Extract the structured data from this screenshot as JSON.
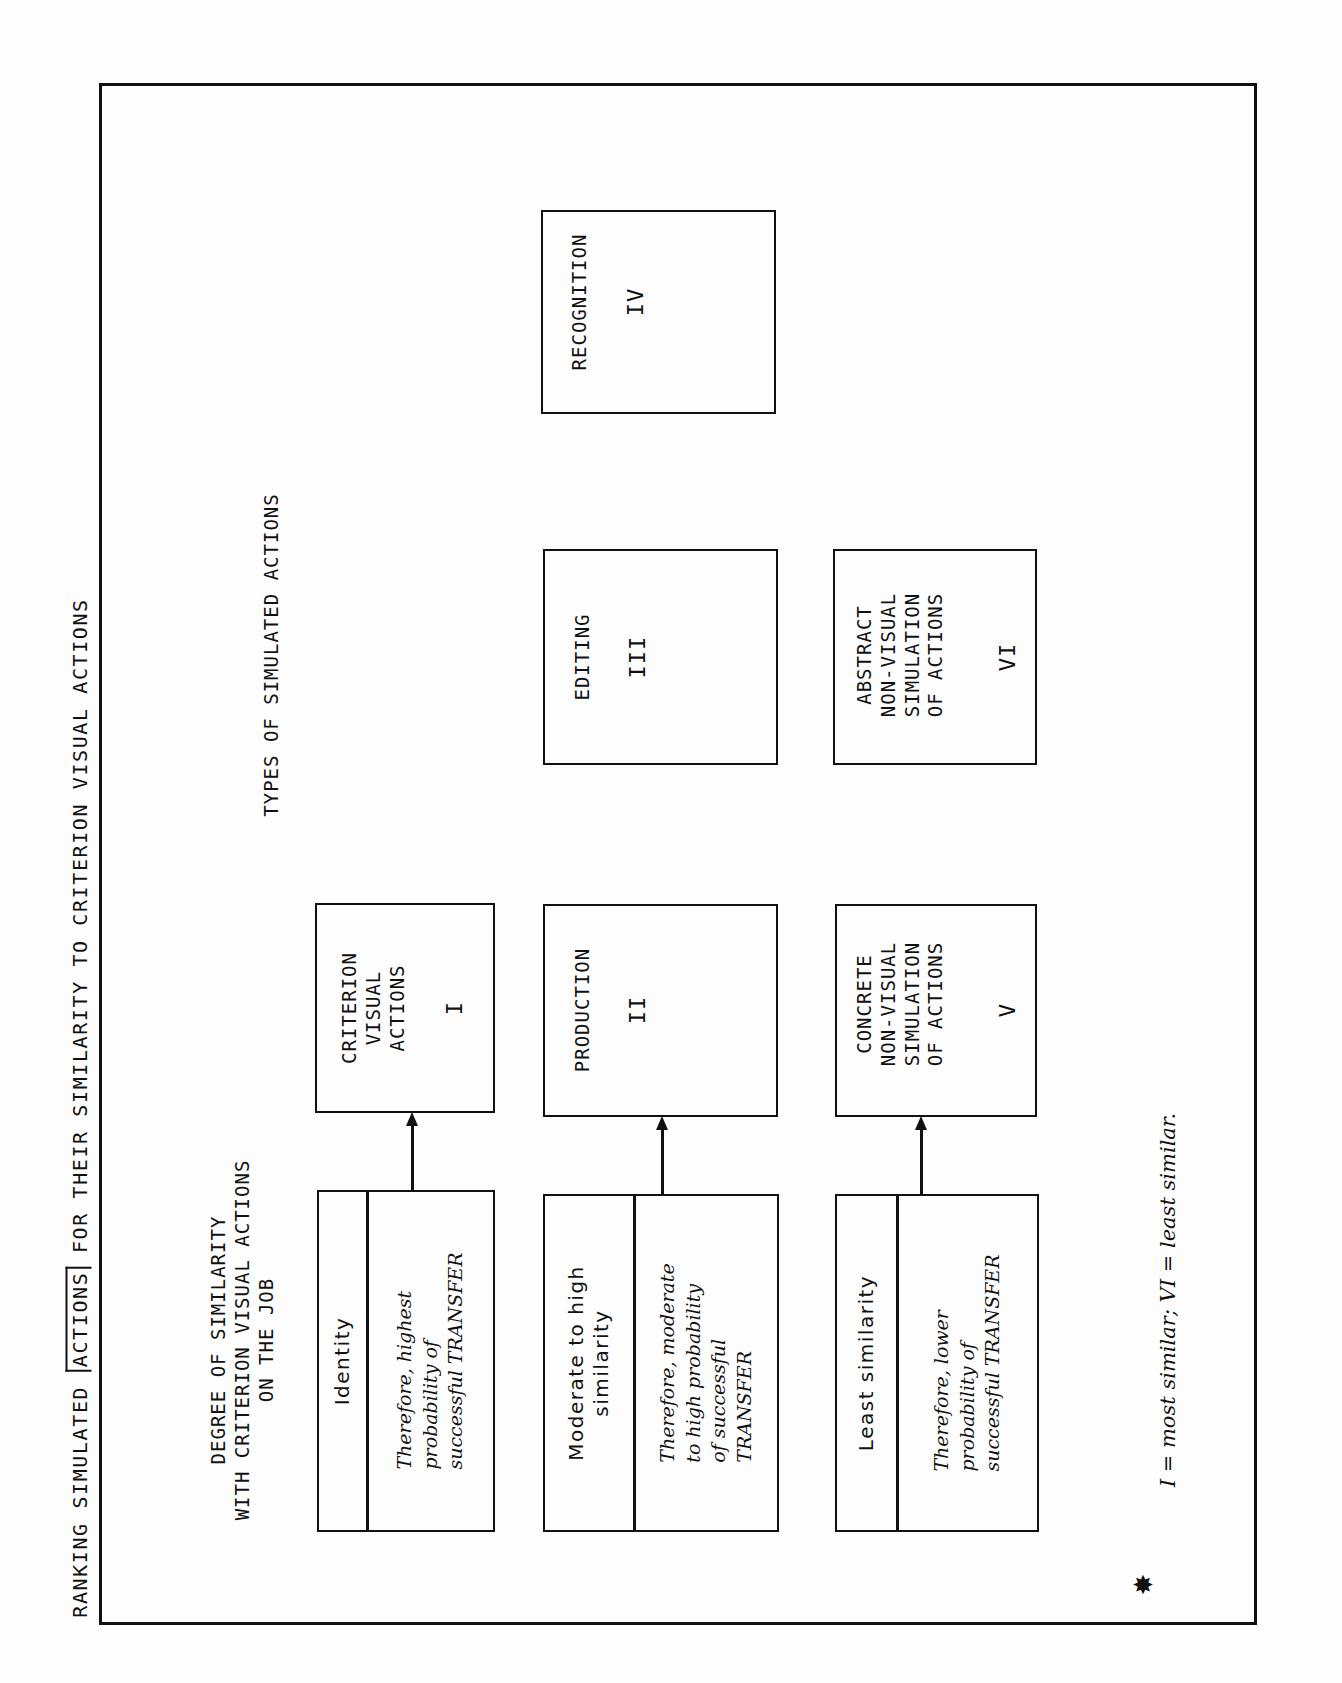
{
  "title": {
    "before": "RANKING SIMULATED ",
    "boxed": "ACTIONS",
    "after": " FOR THEIR SIMILARITY TO CRITERION VISUAL ACTIONS"
  },
  "headers": {
    "degree": "DEGREE OF SIMILARITY\nWITH CRITERION VISUAL ACTIONS\nON THE JOB",
    "types": "TYPES OF SIMULATED ACTIONS"
  },
  "similarity_rows": [
    {
      "level": "Identity",
      "description": "Therefore, highest\nprobability of\nsuccessful TRANSFER"
    },
    {
      "level": "Moderate to high\nsimilarity",
      "description": "Therefore, moderate\nto high probability\nof successful\nTRANSFER"
    },
    {
      "level": "Least similarity",
      "description": "Therefore, lower\nprobability of\nsuccessful TRANSFER"
    }
  ],
  "action_types": [
    {
      "name": "CRITERION\nVISUAL\nACTIONS",
      "numeral": "I"
    },
    {
      "name": "PRODUCTION",
      "numeral": "II"
    },
    {
      "name": "EDITING",
      "numeral": "III"
    },
    {
      "name": "RECOGNITION",
      "numeral": "IV"
    },
    {
      "name": "CONCRETE\nNON-VISUAL\nSIMULATION\nOF ACTIONS",
      "numeral": "V"
    },
    {
      "name": "ABSTRACT\nNON-VISUAL\nSIMULATION\nOF ACTIONS",
      "numeral": "VI"
    }
  ],
  "footnote": {
    "marker": "star-icon",
    "text": "I = most similar; VI = least similar."
  }
}
